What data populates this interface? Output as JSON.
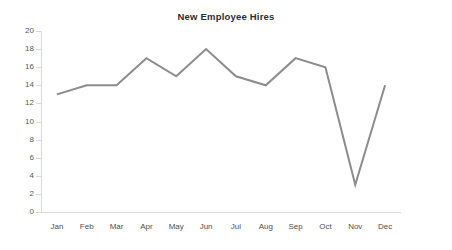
{
  "chart_data": {
    "type": "line",
    "title": "New Employee Hires",
    "xlabel": "",
    "ylabel": "",
    "categories": [
      "Jan",
      "Feb",
      "Mar",
      "Apr",
      "May",
      "Jun",
      "Jul",
      "Aug",
      "Sep",
      "Oct",
      "Nov",
      "Dec"
    ],
    "values": [
      13,
      14,
      14,
      17,
      15,
      18,
      15,
      14,
      17,
      16,
      3,
      14
    ],
    "series": [
      {
        "name": "New Employee Hires",
        "values": [
          13,
          14,
          14,
          17,
          15,
          18,
          15,
          14,
          17,
          16,
          3,
          14
        ]
      }
    ],
    "ylim": [
      0,
      20
    ],
    "y_ticks": [
      0,
      2,
      4,
      6,
      8,
      10,
      12,
      14,
      16,
      18,
      20
    ],
    "y_tick_labels": [
      "0",
      "2",
      "4",
      "6",
      "8",
      "10",
      "12",
      "14",
      "16",
      "18",
      "20"
    ],
    "grid": false,
    "legend": false,
    "legend_position": "none",
    "markers": false,
    "line_color": "#8c8c8c",
    "axis_color": "#d9d9d9",
    "title_color": "#2e2e2e",
    "tick_label_color": "#4f4f4f",
    "background_color": "#ffffff",
    "line_width": 2
  }
}
